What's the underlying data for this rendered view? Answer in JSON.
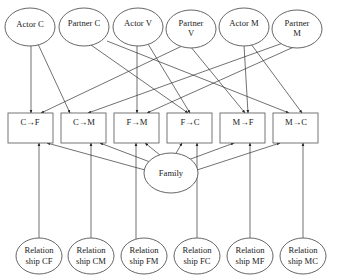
{
  "diagram": {
    "type": "path-model",
    "actor_partner_nodes": [
      {
        "id": "actor_c",
        "lines": [
          "Actor C"
        ]
      },
      {
        "id": "partner_c",
        "lines": [
          "Partner C"
        ]
      },
      {
        "id": "actor_v",
        "lines": [
          "Actor V"
        ]
      },
      {
        "id": "partner_v",
        "lines": [
          "Partner",
          "V"
        ]
      },
      {
        "id": "actor_m",
        "lines": [
          "Actor M"
        ]
      },
      {
        "id": "partner_m",
        "lines": [
          "Partner",
          "M"
        ]
      }
    ],
    "dyad_boxes": [
      {
        "id": "c_f",
        "label": "C→F"
      },
      {
        "id": "c_m",
        "label": "C→M"
      },
      {
        "id": "f_m",
        "label": "F→M"
      },
      {
        "id": "f_c",
        "label": "F→C"
      },
      {
        "id": "m_f",
        "label": "M→F"
      },
      {
        "id": "m_c",
        "label": "M→C"
      }
    ],
    "family_node": {
      "id": "family",
      "label": "Family"
    },
    "relationship_nodes": [
      {
        "id": "rel_cf",
        "lines": [
          "Relation",
          "ship CF"
        ]
      },
      {
        "id": "rel_cm",
        "lines": [
          "Relation",
          "ship CM"
        ]
      },
      {
        "id": "rel_fm",
        "lines": [
          "Relation",
          "ship FM"
        ]
      },
      {
        "id": "rel_fc",
        "lines": [
          "Relation",
          "ship FC"
        ]
      },
      {
        "id": "rel_mf",
        "lines": [
          "Relation",
          "ship MF"
        ]
      },
      {
        "id": "rel_mc",
        "lines": [
          "Relation",
          "ship MC"
        ]
      }
    ],
    "edges": [
      {
        "from": "actor_c",
        "to": "c_f"
      },
      {
        "from": "actor_c",
        "to": "c_m"
      },
      {
        "from": "partner_c",
        "to": "f_c"
      },
      {
        "from": "partner_c",
        "to": "m_c"
      },
      {
        "from": "actor_v",
        "to": "f_m"
      },
      {
        "from": "actor_v",
        "to": "f_c"
      },
      {
        "from": "partner_v",
        "to": "c_f"
      },
      {
        "from": "partner_v",
        "to": "m_f"
      },
      {
        "from": "actor_m",
        "to": "m_f"
      },
      {
        "from": "actor_m",
        "to": "m_c"
      },
      {
        "from": "partner_m",
        "to": "c_m"
      },
      {
        "from": "partner_m",
        "to": "f_m"
      },
      {
        "from": "family",
        "to": "c_f"
      },
      {
        "from": "family",
        "to": "c_m"
      },
      {
        "from": "family",
        "to": "f_m"
      },
      {
        "from": "family",
        "to": "f_c"
      },
      {
        "from": "family",
        "to": "m_f"
      },
      {
        "from": "family",
        "to": "m_c"
      },
      {
        "from": "rel_cf",
        "to": "c_f"
      },
      {
        "from": "rel_cm",
        "to": "c_m"
      },
      {
        "from": "rel_fm",
        "to": "f_m"
      },
      {
        "from": "rel_fc",
        "to": "f_c"
      },
      {
        "from": "rel_mf",
        "to": "m_f"
      },
      {
        "from": "rel_mc",
        "to": "m_c"
      }
    ],
    "colors": {
      "stroke": "#555555",
      "text": "#222222",
      "background": "#ffffff"
    }
  }
}
